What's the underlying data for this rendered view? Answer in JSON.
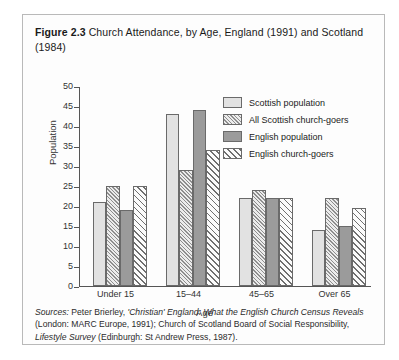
{
  "figure": {
    "number": "Figure 2.3",
    "caption": "Church Attendance, by Age, England (1991) and Scotland (1984)"
  },
  "sources": {
    "lead": "Sources:",
    "part1": " Peter Brierley, ",
    "italic1": "'Christian' England: What the English Church Census Reveals",
    "part2": " (London: MARC Europe, 1991); Church of Scotland Board of Social Responsibility, ",
    "italic2": "Lifestyle Survey",
    "part3": " (Edinburgh: St Andrew Press, 1987)."
  },
  "chart_data": {
    "type": "bar",
    "title": "Church Attendance, by Age, England (1991) and Scotland (1984)",
    "xlabel": "Age",
    "ylabel": "Population",
    "ylim": [
      0,
      50
    ],
    "yticks": [
      0,
      5,
      10,
      15,
      20,
      25,
      30,
      35,
      40,
      45,
      50
    ],
    "grid": false,
    "legend_position": "upper right",
    "categories": [
      "Under 15",
      "15–44",
      "45–65",
      "Over 65"
    ],
    "series": [
      {
        "name": "Scottish population",
        "key": "scotpop",
        "values": [
          21,
          43,
          22,
          14
        ]
      },
      {
        "name": "All Scottish church-goers",
        "key": "scotchurch",
        "values": [
          25,
          29,
          24,
          22
        ]
      },
      {
        "name": "English population",
        "key": "engpop",
        "values": [
          19,
          44,
          22,
          15
        ]
      },
      {
        "name": "English church-goers",
        "key": "engchurch",
        "values": [
          25,
          34,
          22,
          19.5
        ]
      }
    ]
  }
}
